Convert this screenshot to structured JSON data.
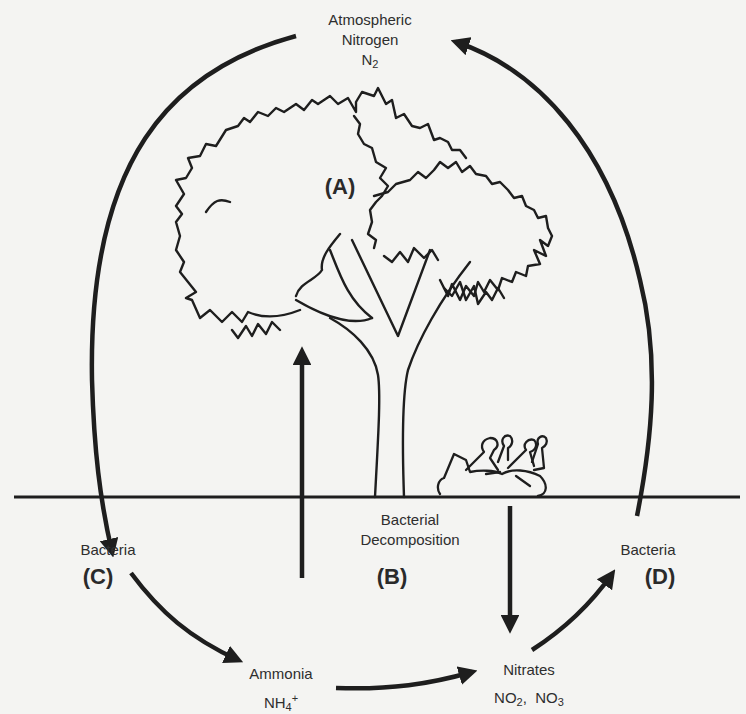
{
  "diagram": {
    "colors": {
      "background": "#f4f4f2",
      "ink": "#1e1e1e",
      "text": "#2e2e2e"
    },
    "nodes": {
      "atmosphere": {
        "line1": "Atmospheric",
        "line2": "Nitrogen",
        "formula_base": "N",
        "formula_sub": "2"
      },
      "tree": {
        "tag": "(A)"
      },
      "decomposition": {
        "line1": "Bacterial",
        "line2": "Decomposition",
        "tag": "(B)"
      },
      "bacteria_left": {
        "label": "Bacteria",
        "tag": "(C)"
      },
      "bacteria_right": {
        "label": "Bacteria",
        "tag": "(D)"
      },
      "ammonia": {
        "label": "Ammonia",
        "formula_base": "NH",
        "formula_sub": "4",
        "formula_sup": "+"
      },
      "nitrates": {
        "label": "Nitrates",
        "f1_base": "NO",
        "f1_sub": "2",
        "sep": ",  ",
        "f2_base": "NO",
        "f2_sub": "3"
      }
    },
    "arrows": [
      {
        "from": "atmosphere",
        "to": "bacteria_left",
        "shape": "arc-left"
      },
      {
        "from": "bacteria_left",
        "to": "ammonia",
        "shape": "curve"
      },
      {
        "from": "ammonia",
        "to": "nitrates",
        "shape": "curve"
      },
      {
        "from": "nitrates",
        "to": "bacteria_right",
        "shape": "curve"
      },
      {
        "from": "bacteria_right",
        "to": "atmosphere",
        "shape": "arc-right"
      },
      {
        "from": "soil",
        "to": "tree",
        "shape": "vertical-up"
      },
      {
        "from": "dead-animal",
        "to": "nitrates",
        "shape": "vertical-down"
      }
    ]
  }
}
